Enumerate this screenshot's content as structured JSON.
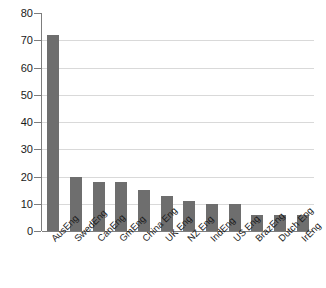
{
  "chart_data": {
    "type": "bar",
    "title": "",
    "subtitle": "",
    "xlabel": "",
    "ylabel": "",
    "categories": [
      "AusEng",
      "SwedEng",
      "CanEng",
      "GmEng",
      "China Eng",
      "UK Eng",
      "NZ Eng",
      "IndEng",
      "US Eng",
      "BrazEng",
      "Dutch Eng",
      "IrEng"
    ],
    "values": [
      72,
      20,
      18,
      18,
      15,
      13,
      11,
      10,
      10,
      6,
      6,
      6
    ],
    "ylim": [
      0,
      80
    ],
    "ytick_step": 10,
    "yticks": [
      0,
      10,
      20,
      30,
      40,
      50,
      60,
      70,
      80
    ],
    "ytick_labels": [
      "0",
      "10",
      "20",
      "30",
      "40",
      "50",
      "60",
      "70",
      "80"
    ],
    "grid": "horizontal",
    "legend": "none",
    "series_color": "#6e6e6e",
    "gridline_color": "#d9d9d9",
    "axis_color": "#7d7d7d",
    "background_color": "#ffffff",
    "xtick_label_rotation": -45
  }
}
